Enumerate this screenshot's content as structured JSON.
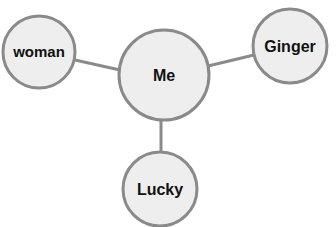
{
  "diagram": {
    "type": "mind-map",
    "colors": {
      "node_fill": "#eeeeee",
      "node_stroke": "#8a8a8a",
      "edge": "#8a8a8a",
      "text": "#111111"
    },
    "nodes": [
      {
        "id": "me",
        "label": "Me",
        "cx": 164,
        "cy": 75,
        "r": 45
      },
      {
        "id": "woman",
        "label": "woman",
        "cx": 39,
        "cy": 52,
        "r": 36
      },
      {
        "id": "ginger",
        "label": "Ginger",
        "cx": 290,
        "cy": 46,
        "r": 37
      },
      {
        "id": "lucky",
        "label": "Lucky",
        "cx": 160,
        "cy": 189,
        "r": 37
      }
    ],
    "edges": [
      {
        "from": "me",
        "to": "woman"
      },
      {
        "from": "me",
        "to": "ginger"
      },
      {
        "from": "me",
        "to": "lucky"
      }
    ]
  }
}
